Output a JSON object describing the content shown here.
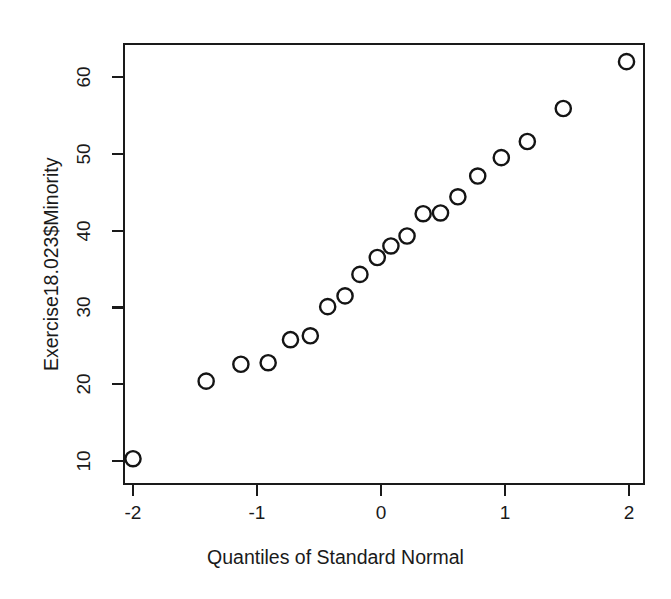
{
  "figure": {
    "background_color": "#ffffff",
    "ink_color": "#1a1a1a",
    "point_marker": "open-circle"
  },
  "chart_data": {
    "type": "scatter",
    "title": "",
    "subtitle": "",
    "xlabel": "Quantiles of Standard Normal",
    "ylabel": "Exercise18.023$Minority",
    "xlim": [
      -2.22,
      2.12
    ],
    "ylim": [
      7.0,
      63.6
    ],
    "xticks": [
      -2,
      -1,
      0,
      1,
      2
    ],
    "xticklabels": [
      "-2",
      "-1",
      "0",
      "1",
      "2"
    ],
    "yticks": [
      10,
      20,
      30,
      40,
      50,
      60
    ],
    "yticklabels": [
      "10",
      "20",
      "30",
      "40",
      "50",
      "60"
    ],
    "grid": false,
    "legend": null,
    "series": [
      {
        "name": "Minority",
        "marker": "open-circle",
        "x": [
          -2.0,
          -1.41,
          -1.13,
          -0.91,
          -0.73,
          -0.57,
          -0.43,
          -0.29,
          -0.17,
          -0.03,
          0.08,
          0.21,
          0.34,
          0.48,
          0.62,
          0.78,
          0.97,
          1.18,
          1.47,
          1.98
        ],
        "y": [
          10.3,
          20.4,
          22.6,
          22.8,
          25.8,
          26.3,
          30.1,
          31.5,
          34.3,
          36.5,
          38.0,
          39.3,
          42.2,
          42.3,
          44.4,
          47.1,
          49.5,
          51.6,
          55.9,
          62.0
        ]
      }
    ],
    "n_points": 20
  },
  "annotations": {
    "x_axis_title": "Quantiles of Standard Normal",
    "y_axis_title": "Exercise18.023$Minority"
  }
}
